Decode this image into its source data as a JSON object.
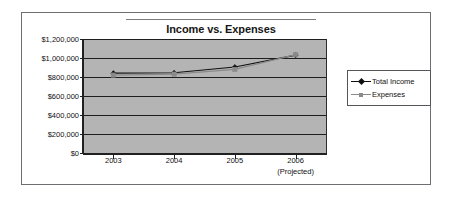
{
  "chart_data": {
    "type": "line",
    "title": "Income vs. Expenses",
    "xlabel": "",
    "ylabel": "",
    "categories": [
      "2003",
      "2004",
      "2005",
      "2006"
    ],
    "category_sublabels": [
      "",
      "",
      "",
      "(Projected)"
    ],
    "series": [
      {
        "name": "Total Income",
        "values": [
          840000,
          845000,
          905000,
          1030000
        ],
        "color": "#101010",
        "marker": "diamond"
      },
      {
        "name": "Expenses",
        "values": [
          820000,
          830000,
          880000,
          1035000
        ],
        "color": "#8a8a8a",
        "marker": "square"
      }
    ],
    "ylim": [
      0,
      1200000
    ],
    "ytick_values": [
      0,
      200000,
      400000,
      600000,
      800000,
      1000000,
      1200000
    ],
    "ytick_labels": [
      "$0",
      "$200,000",
      "$400,000",
      "$600,000",
      "$800,000",
      "$1,000,000",
      "$1,200,000"
    ],
    "grid": true,
    "grid_color": "#1d1d1d",
    "plot_background": "#b4b4b4",
    "legend_position": "right"
  },
  "legend": {
    "entries": [
      {
        "label": "Total Income"
      },
      {
        "label": "Expenses"
      }
    ]
  }
}
